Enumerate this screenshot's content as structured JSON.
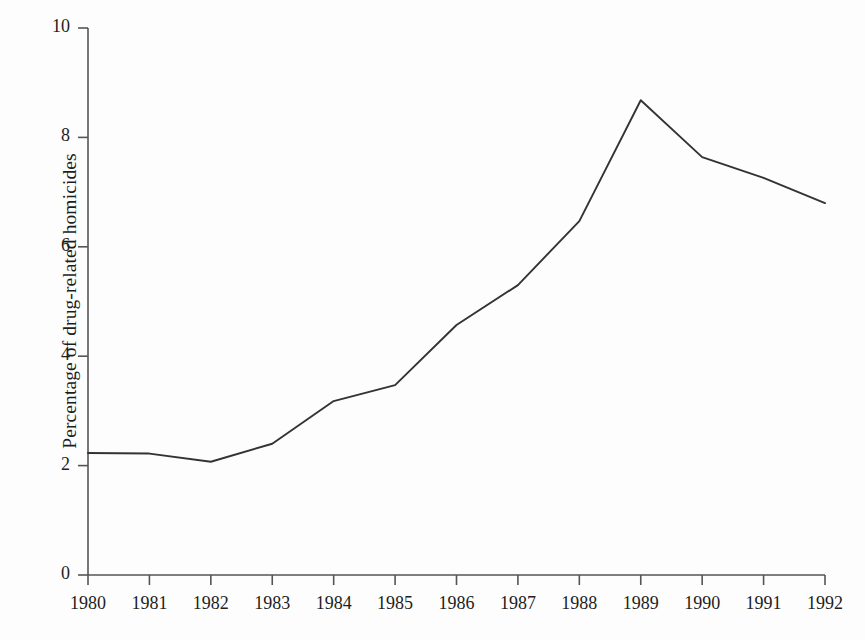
{
  "chart_data": {
    "type": "line",
    "title": "",
    "subtitle": "",
    "xlabel": "",
    "ylabel": "Percentage of drug-related homicides",
    "x": [
      1980,
      1981,
      1982,
      1983,
      1984,
      1985,
      1986,
      1987,
      1988,
      1989,
      1990,
      1991,
      1992
    ],
    "xtick_labels": [
      "1980",
      "1981",
      "1982",
      "1983",
      "1984",
      "1985",
      "1986",
      "1987",
      "1988",
      "1989",
      "1990",
      "1991",
      "1992"
    ],
    "values": [
      2.23,
      2.22,
      2.07,
      2.4,
      3.18,
      3.47,
      4.57,
      5.3,
      6.47,
      8.68,
      7.64,
      7.26,
      6.8
    ],
    "series": [
      {
        "name": "Percentage of drug-related homicides",
        "values": [
          2.23,
          2.22,
          2.07,
          2.4,
          3.18,
          3.47,
          4.57,
          5.3,
          6.47,
          8.68,
          7.64,
          7.26,
          6.8
        ]
      }
    ],
    "ytick_labels": [
      "0",
      "2",
      "4",
      "6",
      "8",
      "10"
    ],
    "ytick_values": [
      0,
      2,
      4,
      6,
      8,
      10
    ],
    "ylim": [
      0,
      10
    ],
    "xlim": [
      1980,
      1992
    ],
    "grid": false,
    "legend": false,
    "legend_position": "none",
    "line_color": "#333333",
    "background_color": "#fdfdfd",
    "axis_color": "#555555",
    "annotations": []
  }
}
